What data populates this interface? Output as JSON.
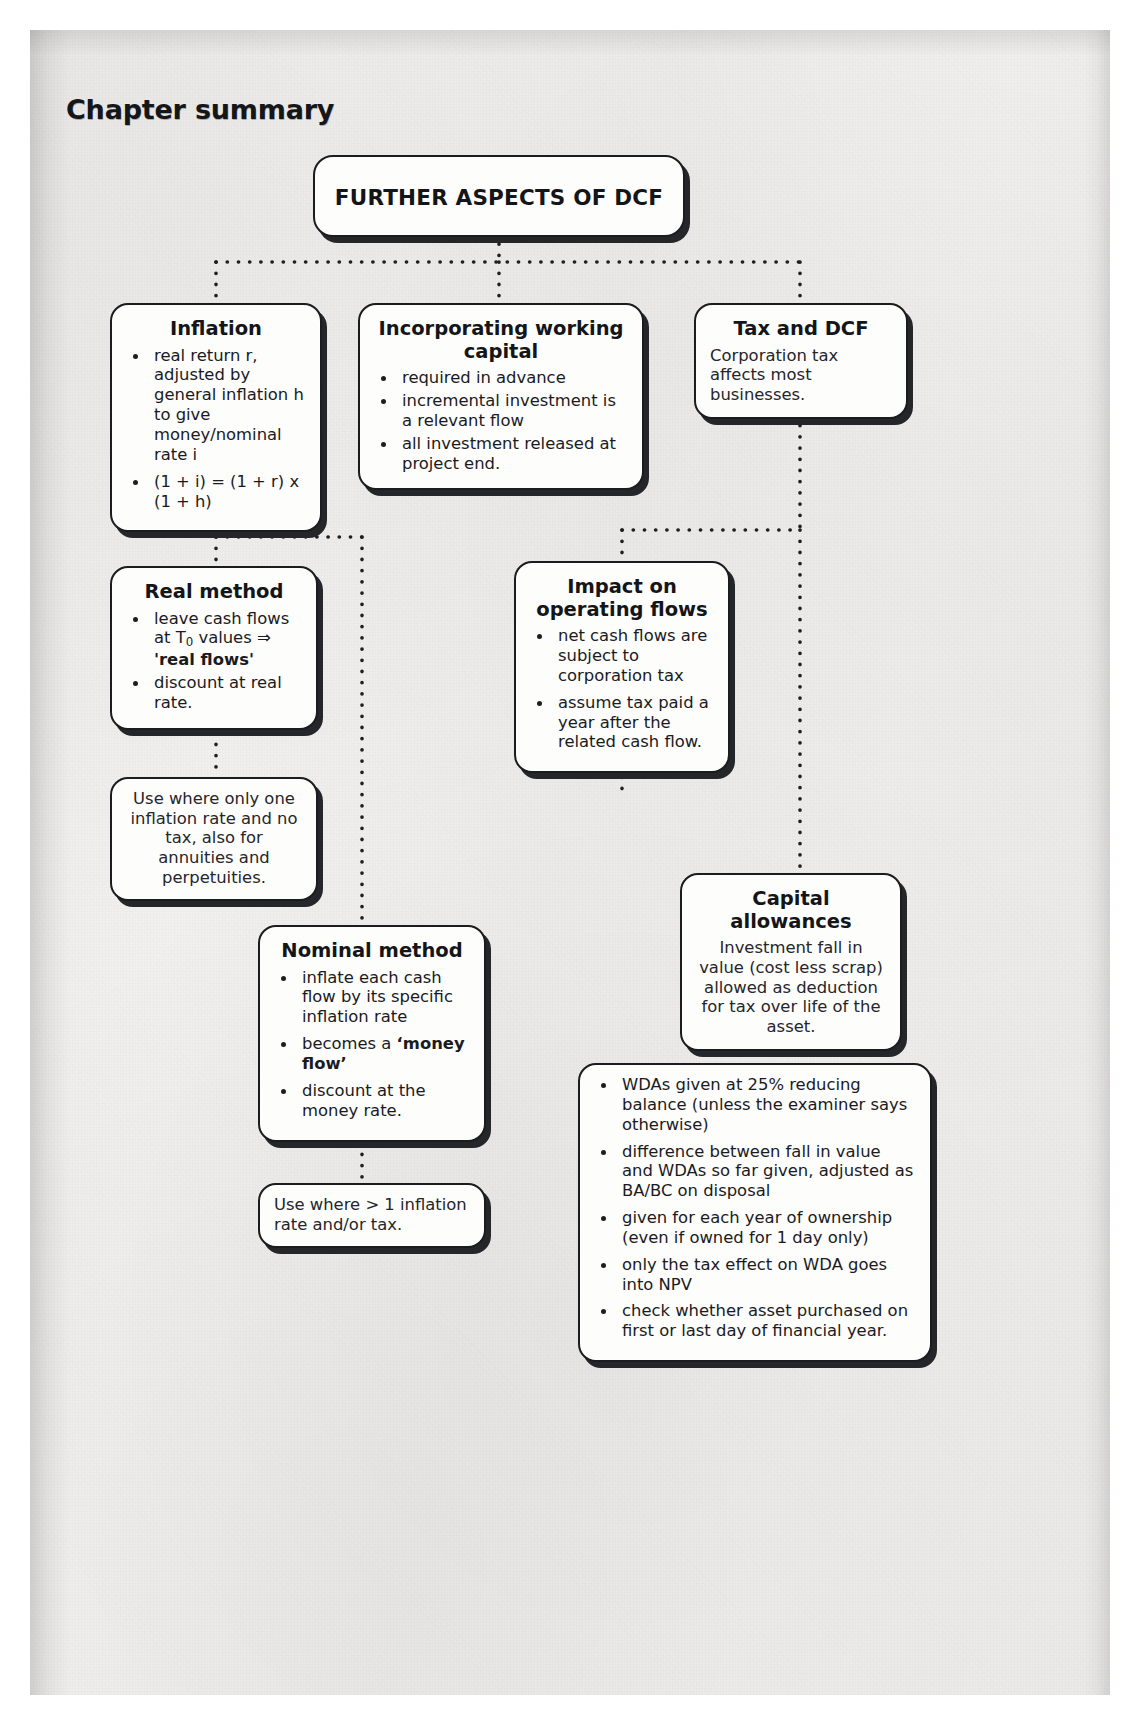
{
  "page": {
    "heading": "Chapter summary"
  },
  "diagram": {
    "type": "mind-map",
    "root": {
      "title": "FURTHER ASPECTS OF DCF"
    },
    "nodes": [
      {
        "id": "inflation",
        "title": "Inflation",
        "bullets": [
          "real return r, adjusted by general inflation h to give money/nominal rate i",
          "(1 + i) = (1 + r) x (1 + h)"
        ]
      },
      {
        "id": "working-capital",
        "title": "Incorporating working capital",
        "bullets": [
          "required in advance",
          "incremental investment is a relevant flow",
          "all investment released at project end."
        ]
      },
      {
        "id": "tax-and-dcf",
        "title": "Tax and DCF",
        "text": "Corporation tax affects most businesses."
      },
      {
        "id": "real-method",
        "title": "Real method",
        "bullets": [
          "leave cash flows at T₀ values ⇒ 'real flows'",
          "discount at real rate."
        ]
      },
      {
        "id": "impact-operating-flows",
        "title": "Impact on operating flows",
        "bullets": [
          "net cash flows are subject to corporation tax",
          "assume tax paid a year after the related cash flow."
        ]
      },
      {
        "id": "use-real",
        "text": "Use where only one inflation rate and no tax, also for annuities and perpetuities."
      },
      {
        "id": "capital-allowances",
        "title": "Capital allowances",
        "text": "Investment fall in value (cost less scrap) allowed as deduction for tax over life of the asset."
      },
      {
        "id": "nominal-method",
        "title": "Nominal method",
        "bullets": [
          "inflate each cash flow by its specific inflation rate",
          "becomes a 'money flow'",
          "discount at the money rate."
        ]
      },
      {
        "id": "use-nominal",
        "text": "Use where > 1 inflation rate and/or tax."
      },
      {
        "id": "wda-details",
        "bullets": [
          "WDAs given at 25% reducing balance (unless the examiner says otherwise)",
          "difference between fall in value and WDAs so far given, adjusted as BA/BC on disposal",
          "given for each year of ownership (even if owned for 1 day only)",
          "only the tax effect on WDA goes into NPV",
          "check whether asset purchased on first or last day of financial year."
        ]
      }
    ],
    "connector_style": "dotted",
    "connector_color": "#1d1e21"
  }
}
